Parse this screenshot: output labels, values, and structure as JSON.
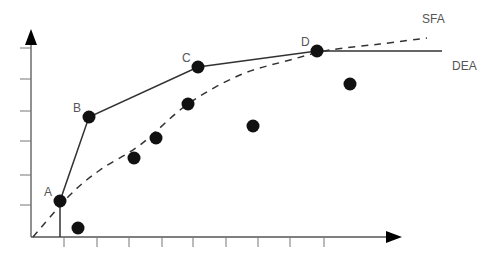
{
  "chart_data": {
    "type": "scatter",
    "title": "",
    "xlabel": "",
    "ylabel": "",
    "grid": false,
    "axis": {
      "origin": [
        33,
        237
      ],
      "x_arrow_tip": [
        402,
        237
      ],
      "y_arrow_tip": [
        29,
        29
      ],
      "x_ticks_px": [
        64,
        97,
        129,
        162,
        193,
        226,
        258,
        290,
        324
      ],
      "y_ticks_px": [
        48,
        79,
        111,
        141,
        175,
        205
      ]
    },
    "labeled_points": [
      {
        "label": "A",
        "x": 60,
        "y": 201
      },
      {
        "label": "B",
        "x": 89,
        "y": 117
      },
      {
        "label": "C",
        "x": 198,
        "y": 67
      },
      {
        "label": "D",
        "x": 317,
        "y": 51
      }
    ],
    "other_points": [
      {
        "x": 78,
        "y": 228
      },
      {
        "x": 134,
        "y": 158
      },
      {
        "x": 156,
        "y": 138
      },
      {
        "x": 188,
        "y": 104
      },
      {
        "x": 253,
        "y": 126
      },
      {
        "x": 350,
        "y": 84
      }
    ],
    "series": [
      {
        "name": "DEA",
        "style": "solid",
        "points": [
          [
            60,
            237
          ],
          [
            60,
            201
          ],
          [
            89,
            117
          ],
          [
            198,
            67
          ],
          [
            317,
            51
          ],
          [
            442,
            51
          ]
        ]
      },
      {
        "name": "SFA",
        "style": "dashed",
        "points": [
          [
            33,
            237
          ],
          [
            70,
            195
          ],
          [
            100,
            170
          ],
          [
            140,
            145
          ],
          [
            188,
            104
          ],
          [
            240,
            75
          ],
          [
            290,
            60
          ],
          [
            330,
            50
          ],
          [
            380,
            44
          ],
          [
            427,
            38
          ]
        ]
      }
    ],
    "legend": [
      {
        "label": "SFA",
        "x": 422,
        "y": 23
      },
      {
        "label": "DEA",
        "x": 452,
        "y": 70
      }
    ]
  },
  "colors": {
    "axis": "#555555",
    "line": "#333333",
    "point": "#111111",
    "label": "#555555"
  }
}
